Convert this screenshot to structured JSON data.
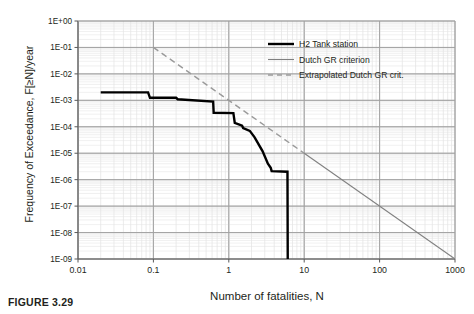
{
  "figure": {
    "caption": "FIGURE 3.29"
  },
  "chart_data": {
    "type": "line",
    "title": "",
    "xlabel": "Number of fatalities, N",
    "ylabel": "Frequency of Exceedance, F[≥N]/year",
    "xscale": "log",
    "yscale": "log",
    "xlim": [
      0.01,
      1000
    ],
    "ylim": [
      1e-09,
      1
    ],
    "grid": true,
    "minor_grid": true,
    "legend_position": "upper right",
    "xticks": [
      "0.01",
      "0.1",
      "1",
      "10",
      "100",
      "1000"
    ],
    "xtick_values": [
      0.01,
      0.1,
      1,
      10,
      100,
      1000
    ],
    "yticks": [
      "1E+00",
      "1E-01",
      "1E-02",
      "1E-03",
      "1E-04",
      "1E-05",
      "1E-06",
      "1E-07",
      "1E-08",
      "1E-09"
    ],
    "ytick_values": [
      1,
      0.1,
      0.01,
      0.001,
      0.0001,
      1e-05,
      1e-06,
      1e-07,
      1e-08,
      1e-09
    ],
    "series": [
      {
        "name": "H2 Tank station",
        "style": "solid-thick",
        "color": "#000000",
        "width": 2.4,
        "x": [
          0.02,
          0.085,
          0.09,
          0.2,
          0.21,
          0.62,
          0.63,
          1.15,
          1.2,
          1.5,
          1.55,
          1.9,
          2.2,
          2.8,
          3.3,
          3.6,
          3.7,
          6.0,
          6.05
        ],
        "y": [
          0.002,
          0.002,
          0.00125,
          0.00125,
          0.0011,
          0.0009,
          0.00034,
          0.00033,
          0.00014,
          0.00011,
          9e-05,
          7e-05,
          4e-05,
          1.2e-05,
          4e-06,
          2.8e-06,
          2.1e-06,
          2e-06,
          1e-09
        ]
      },
      {
        "name": "Dutch GR criterion",
        "style": "solid-thin",
        "color": "#808080",
        "width": 1.1,
        "x": [
          10,
          1000
        ],
        "y": [
          1e-05,
          1e-09
        ]
      },
      {
        "name": "Extrapolated Dutch GR crit.",
        "style": "dashed",
        "color": "#9a9a9a",
        "width": 1.4,
        "x": [
          0.1,
          10
        ],
        "y": [
          0.1,
          1e-05
        ]
      }
    ]
  },
  "legend": {
    "items": [
      {
        "label": "H2 Tank station",
        "swatch": "solid-thick"
      },
      {
        "label": "Dutch GR criterion",
        "swatch": "solid-thin"
      },
      {
        "label": "Extrapolated Dutch GR crit.",
        "swatch": "dashed"
      }
    ]
  }
}
